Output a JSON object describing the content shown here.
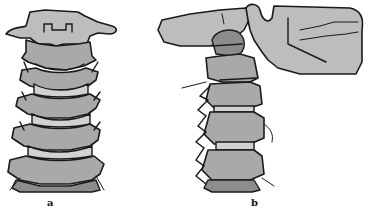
{
  "figure": {
    "panels": [
      {
        "id": "a",
        "label": "a",
        "view": "anterior view of cervical vertebrae"
      },
      {
        "id": "b",
        "label": "b",
        "view": "lateral view of cervical vertebrae with skull base and mandible"
      }
    ]
  },
  "colors": {
    "bone": "#a9a9a9",
    "outline": "#1a1a1a",
    "background": "#ffffff"
  }
}
